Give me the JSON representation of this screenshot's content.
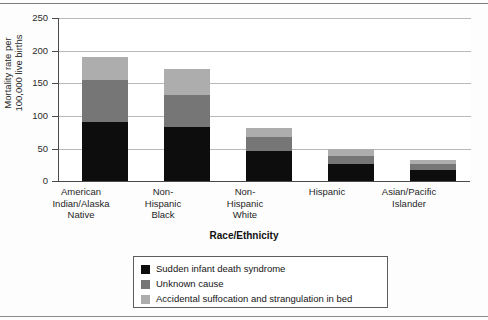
{
  "chart_data": {
    "type": "bar",
    "subtype": "stacked-bar",
    "title": "",
    "xlabel": "Race/Ethnicity",
    "ylabel": "Mortality rate per\n100,000 live births",
    "ylim": [
      0,
      250
    ],
    "yticks": [
      0,
      50,
      100,
      150,
      200,
      250
    ],
    "ytick_labels": [
      "0",
      "50",
      "100",
      "150",
      "200",
      "250"
    ],
    "grid": true,
    "grid_axis": "y",
    "legend_position": "below-plot",
    "categories": [
      "American\nIndian/Alaska\nNative",
      "Non-\nHispanic\nBlack",
      "Non-\nHispanic\nWhite",
      "Hispanic",
      "Asian/Pacific\nIslander"
    ],
    "series": [
      {
        "name": "Sudden infant death syndrome",
        "color": "#0d0d0d",
        "values": [
          92,
          84,
          48,
          28,
          19
        ]
      },
      {
        "name": "Unknown cause",
        "color": "#767676",
        "values": [
          63,
          48,
          21,
          12,
          9
        ]
      },
      {
        "name": "Accidental suffocation and strangulation in bed",
        "color": "#adadad",
        "values": [
          35,
          40,
          14,
          10,
          6
        ]
      }
    ],
    "totals": [
      190,
      172,
      83,
      50,
      34
    ]
  },
  "legend": {
    "items": [
      {
        "label": "Sudden infant death syndrome",
        "color": "#0d0d0d"
      },
      {
        "label": "Unknown cause",
        "color": "#767676"
      },
      {
        "label": "Accidental suffocation and strangulation in bed",
        "color": "#adadad"
      }
    ]
  },
  "axes": {
    "y_title": "Mortality rate per\n100,000 live births",
    "x_title": "Race/Ethnicity",
    "y_tick_labels": [
      "250",
      "200",
      "150",
      "100",
      "50",
      "0"
    ],
    "x_tick_labels": [
      "American\nIndian/Alaska\nNative",
      "Non-\nHispanic\nBlack",
      "Non-\nHispanic\nWhite",
      "Hispanic",
      "Asian/Pacific\nIslander"
    ]
  }
}
